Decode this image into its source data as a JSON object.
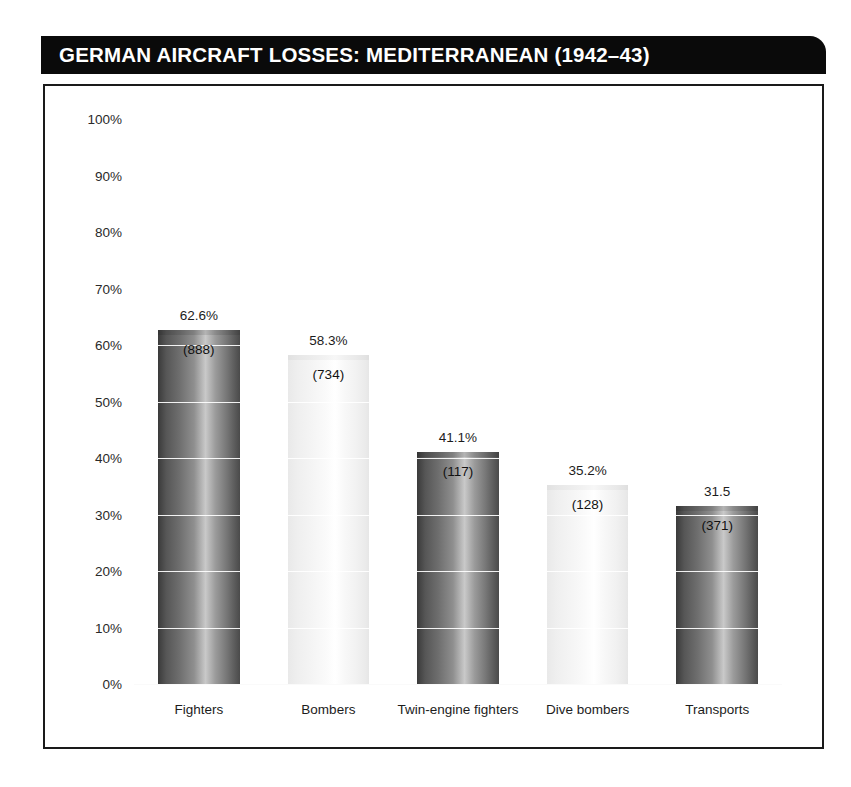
{
  "title": "GERMAN AIRCRAFT LOSSES: MEDITERRANEAN (1942–43)",
  "chart_data": {
    "type": "bar",
    "title": "GERMAN AIRCRAFT LOSSES: MEDITERRANEAN (1942–43)",
    "xlabel": "",
    "ylabel": "",
    "ylim": [
      0,
      100
    ],
    "grid": true,
    "legend": "none",
    "y_ticks": [
      "0%",
      "10%",
      "20%",
      "30%",
      "40%",
      "50%",
      "60%",
      "70%",
      "80%",
      "90%",
      "100%"
    ],
    "y_tick_values": [
      0,
      10,
      20,
      30,
      40,
      50,
      60,
      70,
      80,
      90,
      100
    ],
    "categories": [
      "Fighters",
      "Bombers",
      "Twin-engine fighters",
      "Dive bombers",
      "Transports"
    ],
    "values": [
      62.6,
      58.3,
      41.1,
      35.2,
      31.5
    ],
    "value_labels": [
      "62.6%",
      "58.3%",
      "41.1%",
      "35.2%",
      "31.5"
    ],
    "counts": [
      888,
      734,
      117,
      128,
      371
    ],
    "count_labels": [
      "(888)",
      "(734)",
      "(117)",
      "(128)",
      "(371)"
    ],
    "bar_styles": [
      "dark",
      "light",
      "dark",
      "light",
      "dark"
    ]
  },
  "colors": {
    "banner_background": "#0a0a0a",
    "banner_text": "#ffffff",
    "frame_border": "#1a1a1a",
    "plot_background": "#ffffff",
    "gridline": "#ffffff",
    "bar_dark_edge": "#3a3a3a",
    "bar_dark_highlight": "#c9c9c9",
    "bar_light_edge": "#e6e6e6",
    "bar_light_highlight": "#ffffff",
    "label_text": "#1c1c1c"
  }
}
